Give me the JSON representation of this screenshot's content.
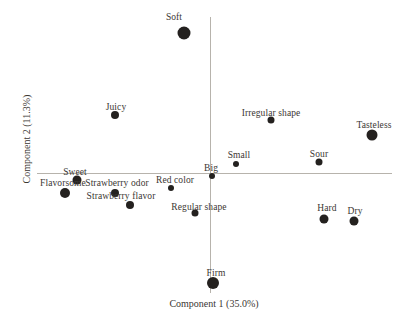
{
  "figure": {
    "background_color": "#ffffff",
    "axis_line_color": "#b7b3ac",
    "marker_color": "#24211f",
    "text_color": "#3b3733",
    "width_px": 409,
    "height_px": 325
  },
  "chart_data": {
    "type": "scatter",
    "title": "",
    "xlabel": "Component 1 (35.0%)",
    "ylabel": "Component 2 (11.3%)",
    "legend": "none",
    "grid": false,
    "tick_labels": "none",
    "xlim": [
      -1,
      1
    ],
    "ylim": [
      -1.05,
      1.05
    ],
    "x_axis": {
      "y_px": 173,
      "x1_px": 37,
      "x2_px": 392,
      "label_cx_px": 214,
      "label_cy_px": 303
    },
    "y_axis": {
      "x_px": 210,
      "y1_px": 17,
      "y2_px": 293,
      "label_cx_px": 26,
      "label_cy_px": 139
    },
    "points": [
      {
        "label": "Soft",
        "x": -0.14,
        "y": 0.93,
        "px": 184,
        "py": 33,
        "size": 13,
        "label_dx": -10,
        "label_dy": -16
      },
      {
        "label": "Juicy",
        "x": -0.53,
        "y": 0.39,
        "px": 115,
        "py": 115,
        "size": 8,
        "label_dx": 1,
        "label_dy": -8
      },
      {
        "label": "Irregular shape",
        "x": 0.34,
        "y": 0.35,
        "px": 271,
        "py": 120,
        "size": 7,
        "label_dx": 0,
        "label_dy": -7
      },
      {
        "label": "Tasteless",
        "x": 0.9,
        "y": 0.25,
        "px": 372,
        "py": 135,
        "size": 11,
        "label_dx": 2,
        "label_dy": -10
      },
      {
        "label": "Small",
        "x": 0.14,
        "y": 0.06,
        "px": 236,
        "py": 164,
        "size": 6,
        "label_dx": 3,
        "label_dy": -9
      },
      {
        "label": "Sour",
        "x": 0.61,
        "y": 0.07,
        "px": 319,
        "py": 162,
        "size": 7,
        "label_dx": 0,
        "label_dy": -8
      },
      {
        "label": "Big",
        "x": 0.01,
        "y": -0.02,
        "px": 212,
        "py": 176,
        "size": 6,
        "label_dx": -1,
        "label_dy": -8
      },
      {
        "label": "Sweet",
        "x": -0.74,
        "y": -0.05,
        "px": 77,
        "py": 180,
        "size": 9,
        "label_dx": -2,
        "label_dy": -8
      },
      {
        "label": "Flavorsome",
        "x": -0.81,
        "y": -0.13,
        "px": 65,
        "py": 193,
        "size": 10,
        "label_dx": -2,
        "label_dy": -10
      },
      {
        "label": "Strawberry odor",
        "x": -0.52,
        "y": -0.14,
        "px": 115,
        "py": 193,
        "size": 8,
        "label_dx": 2,
        "label_dy": -10
      },
      {
        "label": "Red color",
        "x": -0.22,
        "y": -0.1,
        "px": 171,
        "py": 188,
        "size": 6,
        "label_dx": 4,
        "label_dy": -8
      },
      {
        "label": "Strawberry flavor",
        "x": -0.44,
        "y": -0.21,
        "px": 130,
        "py": 205,
        "size": 8,
        "label_dx": -9,
        "label_dy": -9
      },
      {
        "label": "Regular shape",
        "x": -0.08,
        "y": -0.27,
        "px": 195,
        "py": 213,
        "size": 7,
        "label_dx": 4,
        "label_dy": -6
      },
      {
        "label": "Hard",
        "x": 0.63,
        "y": -0.31,
        "px": 324,
        "py": 219,
        "size": 9,
        "label_dx": 3,
        "label_dy": -11
      },
      {
        "label": "Dry",
        "x": 0.8,
        "y": -0.32,
        "px": 354,
        "py": 221,
        "size": 9,
        "label_dx": 1,
        "label_dy": -10
      },
      {
        "label": "Firm",
        "x": 0.02,
        "y": -0.73,
        "px": 213,
        "py": 283,
        "size": 12,
        "label_dx": 3,
        "label_dy": -10
      }
    ]
  }
}
